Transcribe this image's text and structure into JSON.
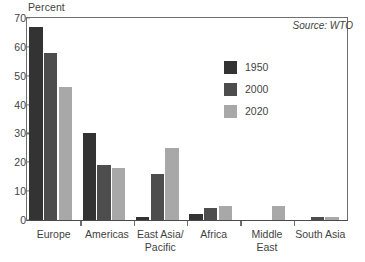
{
  "chart_data": {
    "type": "bar",
    "title": "",
    "subtitle": "",
    "xlabel": "",
    "ylabel": "Percent",
    "ylim": [
      0,
      70
    ],
    "ytick_values": [
      0,
      10,
      20,
      30,
      40,
      50,
      60,
      70
    ],
    "ytick_labels": [
      "0",
      "10",
      "20",
      "30",
      "40",
      "50",
      "60",
      "70"
    ],
    "grid": false,
    "legend_position": "upper-right-inside",
    "categories": [
      "Europe",
      "Americas",
      "East Asia/\nPacific",
      "Africa",
      "Middle\nEast",
      "South Asia"
    ],
    "series": [
      {
        "name": "1950",
        "color": "#333333",
        "values": [
          67,
          30,
          1,
          2,
          0,
          0
        ]
      },
      {
        "name": "2000",
        "color": "#4d4d4d",
        "values": [
          58,
          19,
          16,
          4,
          0,
          1
        ]
      },
      {
        "name": "2020",
        "color": "#a8a8a8",
        "values": [
          46,
          18,
          25,
          5,
          5,
          1
        ]
      }
    ],
    "annotations": [
      {
        "name": "source",
        "text": "Source: WTO"
      }
    ]
  },
  "colors": {
    "series_1950": "#333333",
    "series_2000": "#4d4d4d",
    "series_2020": "#a8a8a8",
    "axis": "#6f6f6f",
    "text": "#3f3f3f",
    "background": "#ffffff"
  }
}
